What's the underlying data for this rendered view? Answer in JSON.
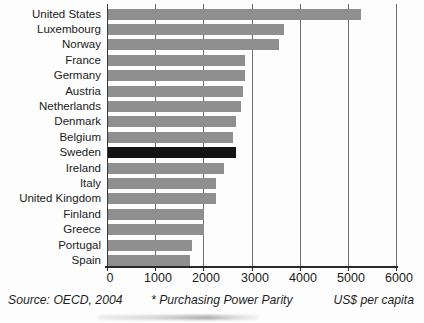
{
  "chart_data": {
    "type": "bar",
    "orientation": "horizontal",
    "title": "",
    "categories": [
      "United States",
      "Luxembourg",
      "Norway",
      "France",
      "Germany",
      "Austria",
      "Netherlands",
      "Denmark",
      "Belgium",
      "Sweden",
      "Ireland",
      "Italy",
      "United Kingdom",
      "Finland",
      "Greece",
      "Portugal",
      "Spain"
    ],
    "values": [
      5250,
      3650,
      3550,
      2850,
      2850,
      2800,
      2750,
      2650,
      2600,
      2650,
      2400,
      2250,
      2250,
      2000,
      2000,
      1750,
      1700
    ],
    "highlight_category": "Sweden",
    "highlight_index": 9,
    "xlabel": "US$ per capita",
    "ylabel": "",
    "xlim": [
      0,
      6000
    ],
    "xticks": [
      0,
      1000,
      2000,
      3000,
      4000,
      5000,
      6000
    ],
    "grid": "vertical gridlines every 1000, full plot height",
    "legend": "none",
    "colors": {
      "bar": "#8f8f8f",
      "highlight_bar": "#141414",
      "gridline": "#6e6e6e",
      "axis": "#2a2a2a",
      "text": "#1b1b1b",
      "background": "#fdfdfd"
    }
  },
  "footer": {
    "source": "Source: OECD, 2004",
    "ppp_note": "* Purchasing Power Parity",
    "unit_label": "US$ per capita"
  }
}
